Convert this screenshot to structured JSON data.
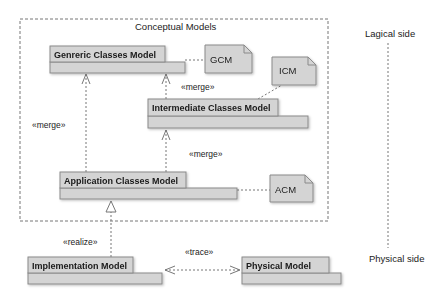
{
  "frame": {
    "label": "Conceptual Models"
  },
  "packages": {
    "generic": {
      "label": "Genreric Classes Model"
    },
    "intermediate": {
      "label": "Intermediate Classes Model"
    },
    "application": {
      "label": "Application Classes Model"
    },
    "implementation": {
      "label": "Implementation Model"
    },
    "physical": {
      "label": "Physical Model"
    }
  },
  "notes": {
    "gcm": {
      "label": "GCM"
    },
    "icm": {
      "label": "ICM"
    },
    "acm": {
      "label": "ACM"
    }
  },
  "relations": {
    "merge_app_generic": "«merge»",
    "merge_inter_generic": "«merge»",
    "merge_app_inter": "«merge»",
    "realize": "«realize»",
    "trace": "«trace»"
  },
  "sides": {
    "logical": "Lagical side",
    "physical": "Physical side"
  },
  "colors": {
    "package_fill": "#d4d4d4",
    "package_stroke": "#8a8a8a",
    "dashed_line": "#777777",
    "text": "#222222"
  }
}
